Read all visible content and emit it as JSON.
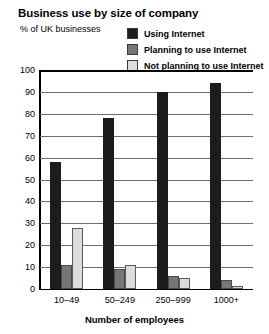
{
  "chart_data": {
    "type": "bar",
    "title": "Business use by size of company",
    "subtitle": "% of UK businesses",
    "xlabel": "Number of employees",
    "ylabel": "",
    "ylim": [
      0,
      100
    ],
    "yticks": [
      0,
      10,
      20,
      30,
      40,
      50,
      60,
      70,
      80,
      90,
      100
    ],
    "grid": true,
    "legend_position": "top-right",
    "categories": [
      "10–49",
      "50–249",
      "250–999",
      "1000+"
    ],
    "series": [
      {
        "name": "Using Internet",
        "color": "#1c1c1c",
        "values": [
          58,
          78,
          90,
          94
        ]
      },
      {
        "name": "Planning to use Internet",
        "color": "#767676",
        "values": [
          11,
          9,
          6,
          4
        ]
      },
      {
        "name": "Not planning to use Internet",
        "color": "#dcdcdc",
        "values": [
          28,
          11,
          5,
          1.5
        ]
      }
    ]
  }
}
